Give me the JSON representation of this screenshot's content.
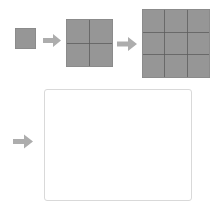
{
  "canvas": {
    "width": 221,
    "height": 214,
    "background_color": "#ffffff"
  },
  "palette": {
    "square_fill": "#969696",
    "square_border": "#8a8a8a",
    "gridline": "#5a5a5a",
    "arrow_fill": "#adadad",
    "empty_rect_border": "#d9d9d9",
    "empty_rect_fill": "#ffffff"
  },
  "diagram": {
    "title": "",
    "steps": [
      {
        "name": "square-1x1",
        "label": "",
        "rows": 1,
        "cols": 1,
        "cells": 1,
        "x": 15,
        "y": 28,
        "width": 21,
        "height": 21
      },
      {
        "name": "arrow-1",
        "icon": "arrow-right-icon",
        "glyph": "→",
        "x": 43,
        "y": 33,
        "width": 18,
        "height": 15
      },
      {
        "name": "square-2x2",
        "label": "",
        "rows": 2,
        "cols": 2,
        "cells": 4,
        "x": 66,
        "y": 19,
        "width": 47,
        "height": 48
      },
      {
        "name": "arrow-2",
        "icon": "arrow-right-icon",
        "glyph": "→",
        "x": 117,
        "y": 36,
        "width": 20,
        "height": 16
      },
      {
        "name": "square-3x3",
        "label": "",
        "rows": 3,
        "cols": 3,
        "cells": 9,
        "x": 142,
        "y": 9,
        "width": 68,
        "height": 69
      },
      {
        "name": "arrow-3",
        "icon": "arrow-right-icon",
        "glyph": "→",
        "x": 13,
        "y": 133,
        "width": 20,
        "height": 17
      },
      {
        "name": "empty-canvas",
        "label": "",
        "rows": 0,
        "cols": 0,
        "cells": 0,
        "x": 44,
        "y": 89,
        "width": 148,
        "height": 112
      }
    ]
  }
}
